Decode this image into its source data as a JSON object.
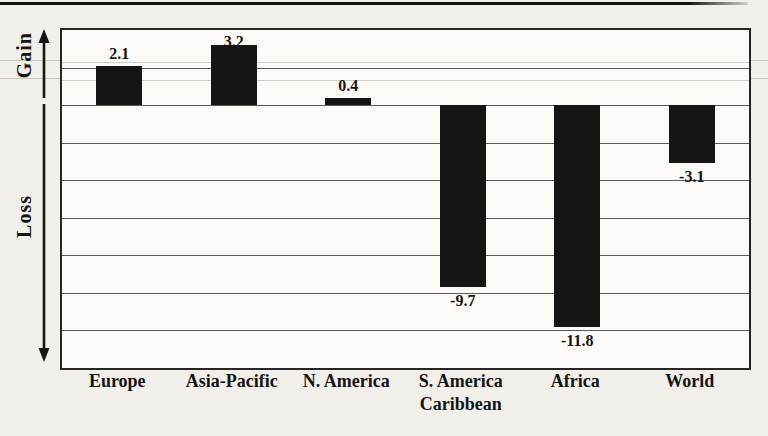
{
  "figure": {
    "gain_annotation": "Gain",
    "loss_annotation": "Loss"
  },
  "chart_data": {
    "type": "bar",
    "title": "",
    "xlabel": "",
    "ylabel": "",
    "categories": [
      "Europe",
      "Asia-Pacific",
      "N. America",
      "S. America\nCaribbean",
      "Africa",
      "World"
    ],
    "values": [
      2.1,
      3.2,
      0.4,
      -9.7,
      -11.8,
      -3.1
    ],
    "value_labels": [
      "2.1",
      "3.2",
      "0.4",
      "-9.7",
      "-11.8",
      "-3.1"
    ],
    "gain_annotation": "Gain",
    "loss_annotation": "Loss",
    "ylim": [
      -14,
      4
    ],
    "grid_step": 2,
    "grid": true,
    "legend": "none",
    "bar_color": "#141414",
    "zero_baseline": 0
  }
}
